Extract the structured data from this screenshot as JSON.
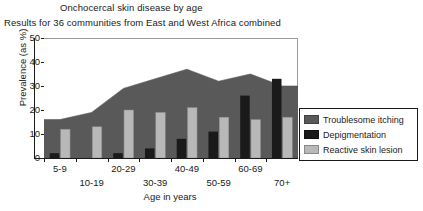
{
  "titles": {
    "main": "Onchocercal skin disease by age",
    "sub": "Results for 36 communities from East and West Africa combined"
  },
  "axes": {
    "ylabel": "Prevalence (as %)",
    "xlabel": "Age in years",
    "yticks": [
      "0",
      "10",
      "20",
      "30",
      "40",
      "50"
    ]
  },
  "legend": {
    "items": [
      {
        "label": "Troublesome itching",
        "color": "#595959"
      },
      {
        "label": "Depigmentation",
        "color": "#1a1a1a"
      },
      {
        "label": "Reactive skin lesion",
        "color": "#b8b8b8"
      }
    ]
  },
  "colors": {
    "itching": "#595959",
    "depigmentation": "#1a1a1a",
    "reactive": "#b8b8b8",
    "axis": "#1a1a1a",
    "frame": "#9a9a9a",
    "background": "#ffffff"
  },
  "chart_data": {
    "type": "area",
    "title": "Onchocercal skin disease by age",
    "subtitle": "Results for 36 communities from East and West Africa combined",
    "xlabel": "Age in years",
    "ylabel": "Prevalence (as %)",
    "ylim": [
      0,
      50
    ],
    "ytick_step": 10,
    "grid": false,
    "legend_position": "right",
    "categories": [
      "5-9",
      "10-19",
      "20-29",
      "30-39",
      "40-49",
      "50-59",
      "60-69",
      "70+"
    ],
    "series": [
      {
        "name": "Troublesome itching",
        "render": "area",
        "color": "#595959",
        "values": [
          16,
          19,
          29,
          33,
          37,
          32,
          35,
          30
        ]
      },
      {
        "name": "Depigmentation",
        "render": "bar",
        "color": "#1a1a1a",
        "values": [
          2,
          0,
          2,
          4,
          8,
          11,
          26,
          33
        ]
      },
      {
        "name": "Reactive skin lesion",
        "render": "bar",
        "color": "#b8b8b8",
        "values": [
          12,
          13,
          20,
          19,
          21,
          17,
          16,
          17
        ]
      }
    ]
  }
}
